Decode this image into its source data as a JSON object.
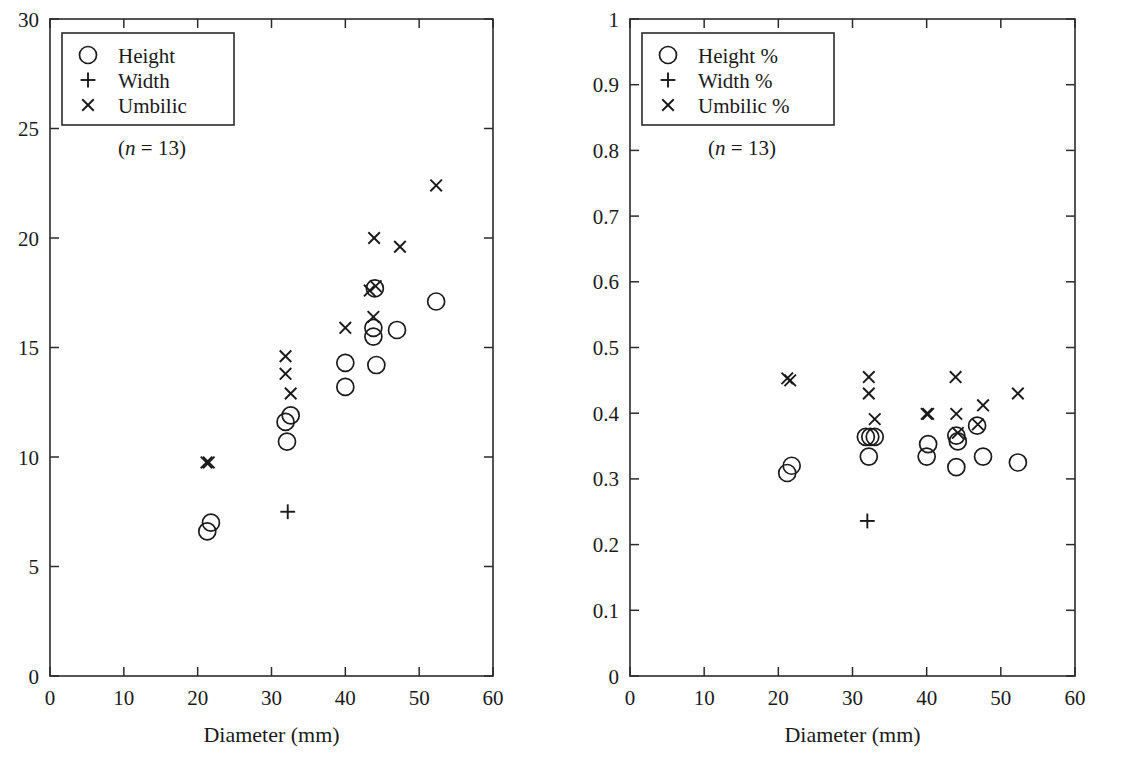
{
  "figure": {
    "background": "#ffffff",
    "ink": "#1a1a1a",
    "panels": [
      "left",
      "right"
    ]
  },
  "chart_data": [
    {
      "id": "left",
      "type": "scatter",
      "title": "",
      "xlabel": "Diameter (mm)",
      "ylabel": "",
      "xlim": [
        0,
        60
      ],
      "ylim": [
        0,
        30
      ],
      "xticks": [
        0,
        10,
        20,
        30,
        40,
        50,
        60
      ],
      "yticks": [
        0,
        5,
        10,
        15,
        20,
        25,
        30
      ],
      "xtick_labels": [
        "0",
        "10",
        "20",
        "30",
        "40",
        "50",
        "60"
      ],
      "ytick_labels": [
        "0",
        "5",
        "10",
        "15",
        "20",
        "25",
        "30"
      ],
      "grid": false,
      "legend_position": "top-left",
      "annotation": "(n = 13)",
      "annotation_n": "13",
      "legend": [
        {
          "marker": "circle",
          "label": "Height"
        },
        {
          "marker": "plus",
          "label": "Width"
        },
        {
          "marker": "cross",
          "label": "Umbilic"
        }
      ],
      "series": [
        {
          "name": "Height",
          "marker": "circle",
          "points": [
            [
              21.3,
              6.6
            ],
            [
              21.8,
              7.0
            ],
            [
              31.9,
              11.6
            ],
            [
              32.6,
              11.9
            ],
            [
              32.1,
              10.7
            ],
            [
              40.0,
              14.3
            ],
            [
              40.0,
              13.2
            ],
            [
              44.0,
              17.7
            ],
            [
              43.8,
              15.9
            ],
            [
              43.8,
              15.5
            ],
            [
              44.2,
              14.2
            ],
            [
              47.0,
              15.8
            ],
            [
              52.3,
              17.1
            ]
          ]
        },
        {
          "name": "Width",
          "marker": "plus",
          "points": [
            [
              32.2,
              7.5
            ]
          ]
        },
        {
          "name": "Umbilic",
          "marker": "cross",
          "points": [
            [
              21.2,
              9.75
            ],
            [
              21.5,
              9.75
            ],
            [
              31.9,
              14.6
            ],
            [
              31.9,
              13.8
            ],
            [
              32.6,
              12.9
            ],
            [
              40.0,
              15.9
            ],
            [
              43.9,
              20.0
            ],
            [
              43.3,
              17.6
            ],
            [
              44.1,
              17.8
            ],
            [
              43.8,
              16.4
            ],
            [
              47.4,
              19.6
            ],
            [
              52.3,
              22.4
            ]
          ]
        }
      ]
    },
    {
      "id": "right",
      "type": "scatter",
      "title": "",
      "xlabel": "Diameter (mm)",
      "ylabel": "",
      "xlim": [
        0,
        60
      ],
      "ylim": [
        0,
        1
      ],
      "xticks": [
        0,
        10,
        20,
        30,
        40,
        50,
        60
      ],
      "yticks": [
        0,
        0.1,
        0.2,
        0.3,
        0.4,
        0.5,
        0.6,
        0.7,
        0.8,
        0.9,
        1
      ],
      "xtick_labels": [
        "0",
        "10",
        "20",
        "30",
        "40",
        "50",
        "60"
      ],
      "ytick_labels": [
        "0",
        "0.1",
        "0.2",
        "0.3",
        "0.4",
        "0.5",
        "0.6",
        "0.7",
        "0.8",
        "0.9",
        "1"
      ],
      "grid": false,
      "legend_position": "top-left",
      "annotation": "(n = 13)",
      "annotation_n": "13",
      "legend": [
        {
          "marker": "circle",
          "label": "Height %"
        },
        {
          "marker": "plus",
          "label": "Width %"
        },
        {
          "marker": "cross",
          "label": "Umbilic %"
        }
      ],
      "series": [
        {
          "name": "Height %",
          "marker": "circle",
          "points": [
            [
              21.2,
              0.309
            ],
            [
              21.8,
              0.32
            ],
            [
              31.8,
              0.364
            ],
            [
              32.4,
              0.364
            ],
            [
              33.0,
              0.364
            ],
            [
              32.2,
              0.334
            ],
            [
              40.2,
              0.353
            ],
            [
              40.0,
              0.334
            ],
            [
              44.0,
              0.366
            ],
            [
              44.2,
              0.357
            ],
            [
              44.0,
              0.318
            ],
            [
              46.8,
              0.381
            ],
            [
              47.6,
              0.334
            ],
            [
              52.3,
              0.325
            ]
          ]
        },
        {
          "name": "Width %",
          "marker": "plus",
          "points": [
            [
              32.0,
              0.236
            ]
          ]
        },
        {
          "name": "Umbilic %",
          "marker": "cross",
          "points": [
            [
              21.2,
              0.453
            ],
            [
              21.6,
              0.45
            ],
            [
              32.2,
              0.455
            ],
            [
              32.2,
              0.43
            ],
            [
              33.0,
              0.391
            ],
            [
              40.0,
              0.399
            ],
            [
              40.2,
              0.399
            ],
            [
              43.9,
              0.455
            ],
            [
              44.0,
              0.399
            ],
            [
              44.2,
              0.37
            ],
            [
              46.9,
              0.383
            ],
            [
              47.6,
              0.412
            ],
            [
              52.3,
              0.43
            ]
          ]
        }
      ]
    }
  ]
}
